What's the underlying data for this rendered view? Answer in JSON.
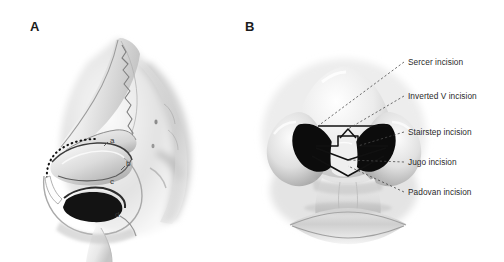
{
  "figure": {
    "background_color": "#ffffff",
    "width": 504,
    "height": 262,
    "type": "medical-illustration"
  },
  "panels": [
    {
      "id": "a",
      "label": "A",
      "view": "lateral profile of nose with cartilage framework",
      "markers": [
        {
          "key": "a",
          "label": "a",
          "x": 110,
          "y": 137
        },
        {
          "key": "b",
          "label": "b",
          "x": 126,
          "y": 160
        },
        {
          "key": "c",
          "label": "c",
          "x": 110,
          "y": 178
        },
        {
          "key": "d",
          "label": "d",
          "x": 115,
          "y": 211
        }
      ]
    },
    {
      "id": "b",
      "label": "B",
      "view": "basal view of nose with nostrils and incision lines"
    }
  ],
  "callouts": [
    {
      "key": "sercer",
      "label": "Sercer incision",
      "y": 58
    },
    {
      "key": "inverted-v",
      "label": "Inverted V incision",
      "y": 92
    },
    {
      "key": "stairstep",
      "label": "Stairstep incision",
      "y": 128
    },
    {
      "key": "jugo",
      "label": "Jugo incision",
      "y": 158
    },
    {
      "key": "padovan",
      "label": "Padovan incision",
      "y": 188
    }
  ],
  "colors": {
    "text": "#2a2a2a",
    "panel_label": "#1b1b1b",
    "leader_line": "#4a4a4a",
    "nostril": "#0d0d0d",
    "skin_light": "#f2f2f2",
    "skin_mid": "#cfcfcf",
    "skin_shadow": "#9a9a9a",
    "outline": "#1a1a1a"
  }
}
